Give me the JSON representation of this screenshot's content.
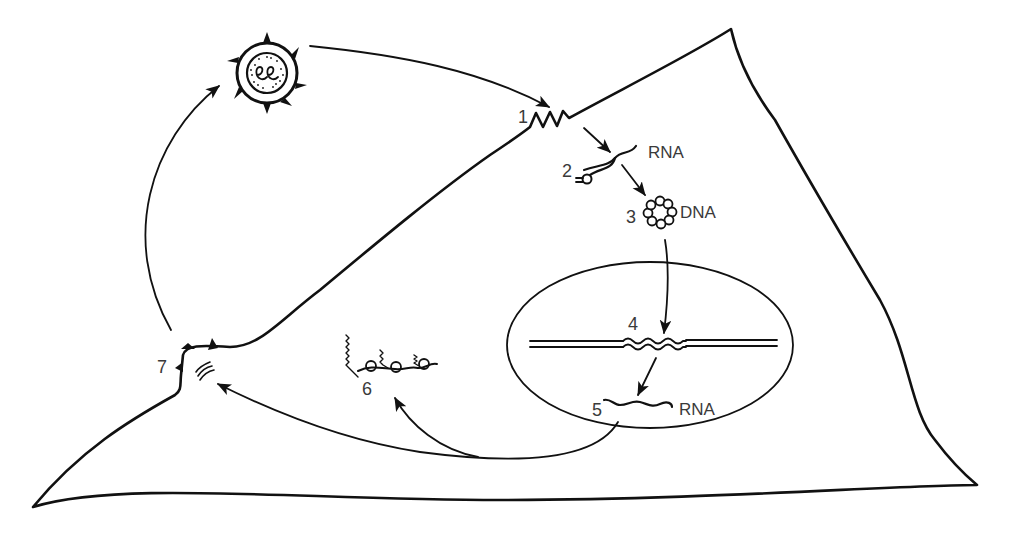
{
  "diagram": {
    "type": "retrovirus-replication-cycle",
    "colors": {
      "ink": "#111111",
      "label": "#3a3a3a",
      "background": "#ffffff"
    },
    "steps": [
      {
        "number": "1",
        "label": ""
      },
      {
        "number": "2",
        "label": "RNA"
      },
      {
        "number": "3",
        "label": "DNA"
      },
      {
        "number": "4",
        "label": ""
      },
      {
        "number": "5",
        "label": "RNA"
      },
      {
        "number": "6",
        "label": ""
      },
      {
        "number": "7",
        "label": ""
      }
    ],
    "elements": {
      "virus_particle": "virus-particle-icon",
      "cell_membrane": "cell-outline",
      "nucleus": "nucleus-ellipse",
      "chromosome": "host-dna-double-line",
      "proviral_insert": "integrated-provirus-wave",
      "polyribosome": "polysome-icon",
      "budding_virion": "budding-site-icon"
    }
  }
}
